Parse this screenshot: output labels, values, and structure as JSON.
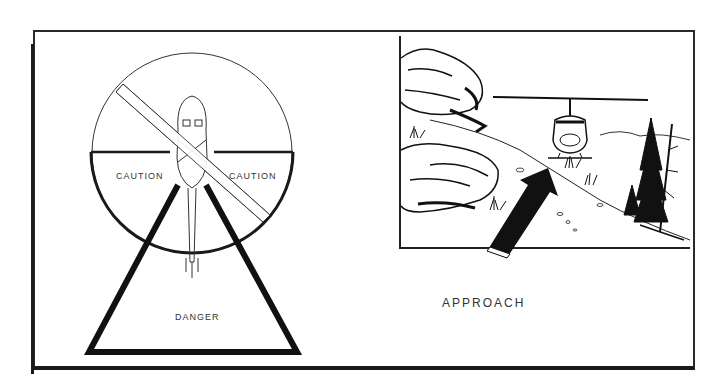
{
  "figure": {
    "left_panel": {
      "zones": {
        "caution_left": "CAUTION",
        "caution_right": "CAUTION",
        "danger": "DANGER"
      },
      "subject": "helicopter-top-view"
    },
    "right_panel": {
      "caption": "APPROACH",
      "subject": "helicopter-landing-scene",
      "arrow": "approach-arrow"
    }
  },
  "colors": {
    "ink": "#1a1a1a",
    "paper": "#ffffff",
    "text": "#333333"
  }
}
